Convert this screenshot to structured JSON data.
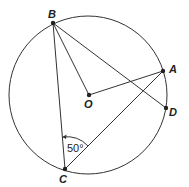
{
  "diagram": {
    "type": "circle-geometry",
    "circle": {
      "center_label": "O",
      "cx": 88,
      "cy": 95,
      "r": 79
    },
    "points": {
      "B": {
        "label": "B",
        "x": 53,
        "y": 23
      },
      "A": {
        "label": "A",
        "x": 163,
        "y": 71
      },
      "D": {
        "label": "D",
        "x": 166,
        "y": 108
      },
      "O": {
        "label": "O",
        "x": 89,
        "y": 95
      },
      "C": {
        "label": "C",
        "x": 65,
        "y": 169
      }
    },
    "segments": [
      "BC",
      "BO",
      "BD",
      "OA",
      "CA"
    ],
    "angle": {
      "vertex": "C",
      "between": [
        "CB",
        "CA"
      ],
      "label": "50°"
    }
  }
}
